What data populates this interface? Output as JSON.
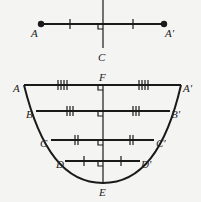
{
  "top_figure": {
    "labels": {
      "A": "A",
      "A_prime": "A′",
      "C": "C"
    }
  },
  "bottom_figure": {
    "labels": {
      "A": "A",
      "A_prime": "A′",
      "B": "B",
      "B_prime": "B′",
      "C": "C",
      "C_prime": "C′",
      "D": "D",
      "D_prime": "D′",
      "E": "E",
      "F": "F"
    },
    "tick_marks": {
      "AA": 4,
      "BB": 3,
      "CC": 2,
      "DD": 1
    }
  },
  "colors": {
    "line": "#1a1a1a",
    "background": "#f4f4f2"
  }
}
